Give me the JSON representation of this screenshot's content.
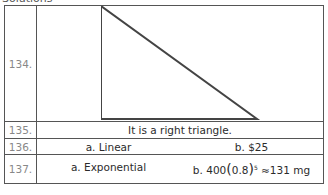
{
  "header": {
    "title": "Solutions"
  },
  "rows": [
    {
      "number": "134.",
      "figure": "right-triangle"
    },
    {
      "number": "135.",
      "answer": "It is a right triangle."
    },
    {
      "number": "136.",
      "a": "a.  Linear",
      "b": "b.  $25"
    },
    {
      "number": "137.",
      "a": "a.  Exponential",
      "b_prefix": "b.  400",
      "b_base": "0.8",
      "b_exp": "5",
      "b_result": "≈131 mg"
    }
  ]
}
